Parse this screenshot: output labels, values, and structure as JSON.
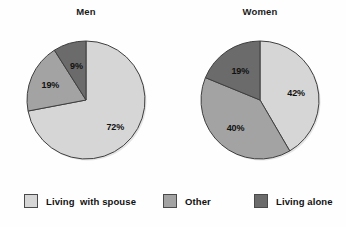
{
  "chart_data": {
    "type": "pie",
    "title": "",
    "grid": false,
    "legend_position": "bottom",
    "categories": [
      "Living  with spouse",
      "Other",
      "Living alone"
    ],
    "colors": [
      "#d6d6d6",
      "#a3a3a3",
      "#6b6b6b"
    ],
    "charts": [
      {
        "title": "Men",
        "labels": [
          "72%",
          "19%",
          "9%"
        ],
        "values": [
          72,
          19,
          9
        ],
        "categories": [
          "Living  with spouse",
          "Other",
          "Living alone"
        ]
      },
      {
        "title": "Women",
        "labels": [
          "42%",
          "40%",
          "19%"
        ],
        "values": [
          42,
          40,
          19
        ],
        "categories": [
          "Living  with spouse",
          "Other",
          "Living alone"
        ]
      }
    ]
  },
  "charts": {
    "men": {
      "title": "Men",
      "slices": [
        {
          "label": "72%",
          "value": 72,
          "color": "#d6d6d6",
          "category": "Living  with spouse"
        },
        {
          "label": "19%",
          "value": 19,
          "color": "#a3a3a3",
          "category": "Other"
        },
        {
          "label": "9%",
          "value": 9,
          "color": "#6b6b6b",
          "category": "Living alone"
        }
      ]
    },
    "women": {
      "title": "Women",
      "slices": [
        {
          "label": "42%",
          "value": 42,
          "color": "#d6d6d6",
          "category": "Living  with spouse"
        },
        {
          "label": "40%",
          "value": 40,
          "color": "#a3a3a3",
          "category": "Other"
        },
        {
          "label": "19%",
          "value": 19,
          "color": "#6b6b6b",
          "category": "Living alone"
        }
      ]
    }
  },
  "legend": {
    "items": [
      {
        "label": "Living  with spouse",
        "color": "#d6d6d6"
      },
      {
        "label": "Other",
        "color": "#a3a3a3"
      },
      {
        "label": "Living alone",
        "color": "#6b6b6b"
      }
    ]
  }
}
